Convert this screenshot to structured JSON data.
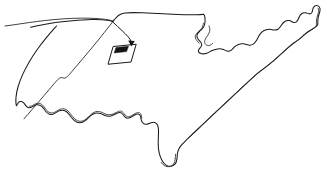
{
  "figure": {
    "kind": "line-drawing",
    "background_color": "#ffffff",
    "stroke_color": "#1a1a1a",
    "width": 327,
    "height": 177,
    "caption": "",
    "labels": []
  },
  "shapes": {
    "outline": {
      "name": "country-outline",
      "description": "Continuous hand-drawn coastline and border outline, tilted clockwise, doubled line along the eastern and southern coasts",
      "stroke_color": "#1a1a1a"
    },
    "northern_border": {
      "name": "northern-border-line",
      "description": "Thin curve running from the left edge to the northern boundary junction",
      "stroke_color": "#2b2b2b"
    },
    "callout_box": {
      "name": "callout-parallelogram",
      "description": "Small parallelogram inset box with a dark filled marker in its upper-left corner",
      "stroke_color": "#1a1a1a",
      "fill_color": "#141414"
    },
    "arrow": {
      "name": "callout-arrow",
      "description": "Curved arrow pointing from the northern border junction down-right into the callout box",
      "stroke_color": "#1a1a1a"
    }
  },
  "paths": {
    "outline_main": "M 30.5,27.2 C 33.0,26.6 36.0,26.0 39.0,25.4 C 46.0,24.0 54.0,22.8 62.0,21.8 C 72.0,20.6 82.0,19.8 92.0,19.6 C 98.0,19.5 104.0,19.8 109.5,20.6 L 112.5,21.4 L 114.0,20.0 C 115.4,18.4 117.0,16.6 118.8,15.3 C 120.6,14.0 122.6,13.1 124.8,12.9 C 130.0,12.5 136.0,12.6 142.0,12.8 C 152.0,13.2 163.0,13.8 173.0,14.3 C 182.0,14.7 190.0,14.9 197.0,14.8 C 199.6,14.7 201.6,14.5 203.2,14.2 L 204.6,15.6 C 205.0,17.6 205.2,20.0 205.0,22.2 C 204.8,24.2 204.3,26.0 203.4,27.3 C 202.4,28.8 201.0,29.9 199.8,31.0 C 198.5,32.2 197.4,33.4 197.0,34.8 C 196.6,36.3 197.1,37.8 198.0,39.0 C 198.9,40.2 200.0,41.1 200.8,42.2 C 201.6,43.3 202.0,44.5 201.6,45.6 C 201.2,46.8 200.2,47.6 199.4,48.6 C 198.6,49.6 198.1,50.8 198.5,51.8 C 199.0,53.0 200.4,53.6 201.8,53.8 C 203.4,54.0 205.2,53.8 206.8,53.2 C 208.5,52.6 210.0,51.6 211.6,50.8 C 213.4,49.9 215.4,49.2 217.4,48.9 C 219.2,48.6 221.0,48.7 222.6,49.2 C 224.2,49.7 225.6,50.6 227.0,51.0 C 228.4,51.4 229.8,51.2 231.0,50.4 C 232.2,49.6 233.1,48.3 234.2,47.2 C 235.4,46.0 236.8,45.0 238.4,44.4 C 240.0,43.8 241.8,43.6 243.4,43.8 C 245.2,44.0 246.8,44.7 248.4,45.0 C 250.0,45.3 251.6,45.2 253.0,44.4 C 254.4,43.6 255.5,42.2 256.4,40.6 C 257.4,38.9 258.2,37.0 259.2,35.4 C 260.4,33.5 261.8,31.9 263.6,30.8 C 265.4,29.7 267.6,29.1 269.6,29.2 C 271.2,29.3 272.6,29.8 274.0,30.0 C 275.4,30.2 276.8,30.0 278.0,29.2 C 279.2,28.4 280.1,27.1 281.0,25.8 C 282.0,24.3 283.0,22.8 284.4,21.8 C 285.8,20.8 287.6,20.3 289.2,20.6 C 290.6,20.9 291.8,21.8 293.0,22.2 C 294.2,22.6 295.5,22.5 296.4,21.8 C 297.4,21.0 298.0,19.6 298.6,18.2 C 299.3,16.6 300.0,15.0 301.2,14.0 C 302.4,13.0 304.0,12.6 305.6,12.8 C 306.9,13.0 308.0,13.6 309.0,13.8 C 310.0,14.0 311.0,13.8 311.6,13.0 C 312.2,12.2 312.4,11.0 312.6,9.8 C 312.9,8.2 313.4,6.6 314.8,6.0 C 316.2,5.4 318.4,5.8 319.4,7.0 C 320.4,8.2 320.2,10.0 319.8,11.6 C 319.4,13.2 318.8,14.8 318.4,16.4 C 318.0,18.0 317.8,19.7 317.8,21.2 C 317.8,22.6 318.0,23.8 317.6,24.8 C 317.2,25.9 316.2,26.6 315.0,27.4 C 313.6,28.3 312.0,29.2 310.4,30.2 C 308.6,31.3 306.8,32.6 305.2,34.0 C 303.4,35.5 301.8,37.2 300.0,38.6 C 298.0,40.2 295.8,41.5 293.8,43.0 C 291.6,44.6 289.6,46.4 287.6,48.2 C 285.4,50.2 283.2,52.2 281.0,54.2 C 278.6,56.4 276.2,58.6 273.8,60.6 C 271.2,62.8 268.6,64.8 266.0,66.8 C 263.2,69.0 260.4,71.0 257.8,73.2 C 255.0,75.5 252.4,78.0 249.8,80.4 C 247.0,83.0 244.2,85.6 241.4,88.2 C 238.4,91.0 235.4,93.8 232.4,96.6 C 229.2,99.6 226.0,102.6 222.8,105.6 C 219.4,108.8 216.0,112.0 212.6,115.2 C 209.0,118.6 205.4,122.0 201.8,125.4 C 198.0,129.0 194.2,132.6 190.4,136.2 C 188.4,138.1 186.4,140.0 184.6,141.8 C 183.4,143.0 182.2,144.2 181.2,145.4 C 180.2,146.6 179.4,147.8 178.8,149.0 C 178.0,150.6 177.6,152.2 177.4,153.8 C 177.2,155.4 177.2,157.0 177.0,158.6 C 176.8,160.4 176.4,162.2 175.4,163.6 C 174.4,165.0 172.8,165.9 171.2,166.2 C 169.6,166.5 168.0,166.2 166.6,165.4 C 165.2,164.6 164.0,163.4 163.0,162.0 C 161.8,160.3 160.9,158.4 160.2,156.4 C 159.4,154.2 158.9,151.9 158.6,149.6 C 158.3,147.2 158.2,144.8 158.2,142.4 C 158.2,140.2 158.3,138.0 158.4,135.8 C 158.5,133.8 158.6,131.8 158.5,129.8 C 158.4,128.0 158.1,126.2 157.4,124.8 C 156.8,123.6 155.9,122.7 154.8,122.4 C 153.6,122.1 152.2,122.4 151.0,122.8 C 149.6,123.3 148.2,124.0 146.8,124.2 C 145.4,124.4 144.0,124.1 143.0,123.2 C 142.0,122.3 141.5,120.9 141.2,119.6 C 140.9,118.3 140.8,117.0 140.4,115.9 C 140.0,114.9 139.2,114.1 138.0,114.0 C 136.8,113.9 135.4,114.5 134.2,115.2 C 132.8,116.0 131.6,117.0 130.2,117.6 C 128.8,118.2 127.2,118.4 126.0,117.8 C 124.8,117.2 124.0,115.9 123.2,114.8 C 122.4,113.7 121.4,112.7 120.0,112.6 C 118.6,112.5 117.0,113.3 115.6,114.0 C 114.0,114.8 112.4,115.6 110.8,116.0 C 109.0,116.4 107.2,116.3 105.6,115.8 C 103.8,115.2 102.2,114.2 100.6,113.6 C 98.8,112.9 96.8,112.7 95.0,113.2 C 93.2,113.7 91.6,114.9 90.2,116.2 C 88.6,117.6 87.2,119.2 85.6,120.4 C 83.8,121.8 81.8,122.8 79.8,122.8 C 77.8,122.8 75.8,121.8 74.2,120.4 C 72.4,118.8 71.0,116.8 69.6,115.0 C 68.2,113.2 66.8,111.6 65.0,110.8 C 63.2,110.0 61.0,110.1 59.2,110.8 C 57.4,111.5 56.0,112.8 54.4,113.6 C 52.8,114.4 51.0,114.7 49.4,114.2 C 47.8,113.7 46.5,112.4 45.4,111.0 C 44.2,109.4 43.2,107.6 41.8,106.4 C 40.4,105.2 38.6,104.6 36.8,104.8 C 35.2,105.0 33.8,105.9 32.6,106.6 C 31.4,107.3 30.2,107.9 29.0,107.8 C 27.8,107.7 26.8,106.9 26.0,105.9 C 25.1,104.8 24.4,103.5 23.4,102.6 C 22.4,101.7 21.0,101.2 19.8,101.6 C 18.6,102.0 17.8,103.2 17.2,104.4 L 16.4,105.8 L 16.0,103.6 C 15.8,101.6 15.8,99.4 16.0,97.2 C 16.3,93.8 17.0,90.4 18.0,87.0 C 19.2,82.8 20.8,78.6 22.6,74.6 C 24.6,70.2 26.8,66.0 29.2,61.9 C 31.8,57.4 34.6,53.2 37.6,49.0 C 40.6,44.8 43.8,40.8 47.0,36.9 C 49.6,33.8 52.2,30.8 54.8,27.9 L 56.6,26.0",
    "outline_inner_shadow": "M 158.4,135.8 C 158.5,133.8 158.6,131.8 158.5,129.8 C 158.4,128.0 158.1,126.2 157.4,124.8 C 156.8,123.6 155.9,122.7 154.8,122.4 C 153.6,122.1 152.2,122.4 151.0,122.8 C 149.6,123.3 148.2,124.0 146.8,124.2 C 145.4,124.4 144.0,124.1 143.0,123.2",
    "coast_double": "M 203.2,14.2 C 201.6,14.5 199.6,14.7 197.0,14.8 C 190.0,14.9 182.0,14.7 173.0,14.3",
    "east_coast_shadow": "M 319.4,7.0 C 320.4,8.2 320.2,10.0 319.8,11.6 C 319.4,13.2 318.8,14.8 318.4,16.4 C 318.0,18.0 317.8,19.7 317.8,21.2 C 317.8,22.6 318.0,23.8 317.6,24.8 C 317.2,25.9 316.2,26.6 315.0,27.4 C 313.6,28.3 312.0,29.2 310.4,30.2 C 308.6,31.3 306.8,32.6 305.2,34.0 C 303.4,35.5 301.8,37.2 300.0,38.6 C 298.0,40.2 295.8,41.5 293.8,43.0 C 291.6,44.6 289.6,46.4 287.6,48.2 C 285.4,50.2 283.2,52.2 281.0,54.2 C 278.6,56.4 276.2,58.6 273.8,60.6 C 271.2,62.8 268.6,64.8 266.0,66.8 C 263.2,69.0 260.4,71.0 257.8,73.2 C 255.0,75.5 252.4,78.0 249.8,80.4 C 247.0,83.0 244.2,85.6 241.4,88.2 C 238.4,91.0 235.4,93.8 232.4,96.6 C 229.2,99.6 226.0,102.6 222.8,105.6 C 219.4,108.8 216.0,112.0 212.6,115.2 C 209.0,118.6 205.4,122.0 201.8,125.4 C 198.0,129.0 194.2,132.6 190.4,136.2",
    "gulf_shadow": "M 141.2,119.6 C 140.9,118.3 140.8,117.0 140.4,115.9 C 140.0,114.9 139.2,114.1 138.0,114.0 C 136.8,113.9 135.4,114.5 134.2,115.2 C 132.8,116.0 131.6,117.0 130.2,117.6 C 128.8,118.2 127.2,118.4 126.0,117.8 C 124.8,117.2 124.0,115.9 123.2,114.8 C 122.4,113.7 121.4,112.7 120.0,112.6 C 118.6,112.5 117.0,113.3 115.6,114.0 C 114.0,114.8 112.4,115.6 110.8,116.0 C 109.0,116.4 107.2,116.3 105.6,115.8 C 103.8,115.2 102.2,114.2 100.6,113.6 C 98.8,112.9 96.8,112.7 95.0,113.2 C 93.2,113.7 91.6,114.9 90.2,116.2 C 88.6,117.6 87.2,119.2 85.6,120.4 C 83.8,121.8 81.8,122.8 79.8,122.8 C 77.8,122.8 75.8,121.8 74.2,120.4 C 72.4,118.8 71.0,116.8 69.6,115.0 C 68.2,113.2 66.8,111.6 65.0,110.8 C 63.2,110.0 61.0,110.1 59.2,110.8 C 57.4,111.5 56.0,112.8 54.4,113.6 C 52.8,114.4 51.0,114.7 49.4,114.2 C 47.8,113.7 46.5,112.4 45.4,111.0 C 44.2,109.4 43.2,107.6 41.8,106.4 C 40.4,105.2 38.6,104.6 36.8,104.8 C 35.2,105.0 33.8,105.9 32.6,106.6 C 31.4,107.3 30.2,107.9 29.0,107.8",
    "florida_shadow": "M 177.4,153.8 C 177.2,155.4 177.2,157.0 177.0,158.6 C 176.8,160.4 176.4,162.2 175.4,163.6 C 174.4,165.0 172.8,165.9 171.2,166.2 C 169.6,166.5 168.0,166.2 166.6,165.4 C 165.2,164.6 164.0,163.4 163.0,162.0",
    "great_lakes_inner": "M 205.0,22.2 C 204.8,24.2 204.3,26.0 203.4,27.3 C 202.4,28.8 201.0,29.9 199.8,31.0 C 198.5,32.2 197.4,33.4 197.0,34.8 C 196.6,36.3 197.1,37.8 198.0,39.0 C 198.9,40.2 200.0,41.1 200.8,42.2",
    "lake_michigan": "M 209.0,26.0 C 209.8,27.6 210.0,29.6 209.6,31.4 C 209.2,33.2 208.2,34.8 207.2,36.2 C 206.2,37.6 205.2,38.9 204.8,40.4 C 204.4,41.9 204.8,43.6 205.8,44.6 C 206.8,45.6 208.4,45.8 209.8,45.4 C 211.0,45.0 212.0,44.1 212.8,43.2",
    "northern_border_line": "M 5.0,26.0 C 10.0,25.4 16.0,24.5 22.0,23.6 C 32.0,22.1 43.0,20.6 54.0,19.6 C 66.0,18.5 78.0,17.9 89.0,18.2 C 97.0,18.4 104.5,19.0 110.0,20.2 L 113.2,21.2",
    "west_border_line": "M 113.2,21.2 C 110.6,24.6 107.6,28.4 104.4,32.4 C 100.0,38.0 95.2,43.8 90.4,49.6 C 85.2,55.8 80.0,62.0 75.0,67.8 C 73.0,70.2 71.2,72.4 69.6,74.2 C 68.2,75.8 67.0,77.0 66.0,77.6 C 65.0,78.2 64.2,78.2 63.4,78.0 C 62.6,77.8 61.8,77.4 60.8,77.6 C 59.8,77.8 58.8,78.6 57.8,79.6 C 56.6,80.8 55.4,82.2 54.2,83.6 C 51.0,87.4 47.6,91.4 44.2,95.4 C 40.0,100.3 35.8,105.2 32.0,109.6 C 29.0,113.1 26.2,116.3 24.0,118.8",
    "callout_box": "M 113.5,46.5 L 136.2,44.2 L 131.0,62.0 L 108.4,64.2 Z",
    "callout_marker": "M 116.0,47.5 L 128.5,46.2 L 126.6,51.6 L 114.2,52.9 Z",
    "arrow_line": "M 113.0,22.2 C 116.0,25.0 119.0,27.8 122.0,30.6 C 124.0,32.5 126.0,34.4 127.6,36.2 C 128.8,37.5 129.8,38.8 130.4,40.0 C 130.9,41.0 131.2,42.0 131.2,43.2",
    "arrow_head": "M 131.4,46.6 L 128.2,40.6 L 134.8,41.0 Z"
  }
}
